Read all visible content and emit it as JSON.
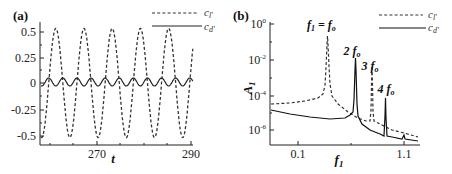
{
  "chart_data": [
    {
      "panel": "(a)",
      "type": "line",
      "title": "",
      "xlabel": "t",
      "ylabel": "",
      "xlim": [
        258,
        290
      ],
      "ylim": [
        -0.6,
        0.6
      ],
      "xticks": [
        "270",
        "290"
      ],
      "yticks": [
        "0.5",
        "0.25",
        "0",
        "-0.25",
        "-0.5"
      ],
      "legend": {
        "position": "upper-right",
        "entries": [
          "c_l'",
          "c_d'"
        ]
      },
      "series": [
        {
          "name": "c_l'",
          "style": "dashed",
          "amplitude": 0.53,
          "period": 5.9,
          "description": "sinusoid oscillating between about -0.53 and 0.52"
        },
        {
          "name": "c_d'",
          "style": "solid",
          "amplitude": 0.03,
          "period": 2.95,
          "description": "small oscillation around 0 at twice the lift frequency"
        }
      ]
    },
    {
      "panel": "(b)",
      "type": "line",
      "title": "",
      "xlabel": "f_1",
      "ylabel": "A_1",
      "yscale": "log",
      "ylim": [
        "1e-7",
        "1e0"
      ],
      "xticks": [
        "0.1",
        "1.1"
      ],
      "yticks": [
        "10^0",
        "10^-2",
        "10^-4",
        "10^-6"
      ],
      "legend": {
        "position": "upper-right",
        "entries": [
          "c_l'",
          "c_d'"
        ]
      },
      "annotations": [
        "f_1 = f_o",
        "2 f_o",
        "3 f_o",
        "4 f_o"
      ],
      "series": [
        {
          "name": "c_l'",
          "style": "dashed",
          "peaks": [
            {
              "label": "f_1 = f_o",
              "A": 0.3
            },
            {
              "label": "3 f_o",
              "A": 0.002
            }
          ],
          "baseline": "about 3e-5 decaying to 5e-7"
        },
        {
          "name": "c_d'",
          "style": "solid",
          "peaks": [
            {
              "label": "2 f_o",
              "A": 0.012
            },
            {
              "label": "4 f_o",
              "A": 8e-05
            }
          ],
          "baseline": "about 1.5e-5 decaying to 2e-7"
        }
      ]
    }
  ],
  "labels": {
    "panel_a": "(a)",
    "panel_b": "(b)",
    "a_xlabel": "t",
    "a_xtick_270": "270",
    "a_xtick_290": "290",
    "a_ytick_05": "0.5",
    "a_ytick_025": "0.25",
    "a_ytick_0": "0",
    "a_ytick_m025": "-0.25",
    "a_ytick_m05": "-0.5",
    "b_xlabel": "f",
    "b_xlabel_sub": "1",
    "b_ylabel": "A",
    "b_ylabel_sub": "1",
    "b_xtick_01": "0.1",
    "b_xtick_11": "1.1",
    "b_ytick_base": "10",
    "b_ytick_0_exp": "0",
    "b_ytick_2_exp": "-2",
    "b_ytick_4_exp": "-4",
    "b_ytick_6_exp": "-6",
    "legend_cl": "c",
    "legend_cl_sub": "l'",
    "legend_cd": "c",
    "legend_cd_sub": "d'",
    "annot_f1": "f",
    "annot_f1_sub": "1",
    "annot_f1_eq": " = f",
    "annot_fo_sub": "o",
    "annot_2": "2 f",
    "annot_3": "3 f",
    "annot_4": "4 f"
  }
}
